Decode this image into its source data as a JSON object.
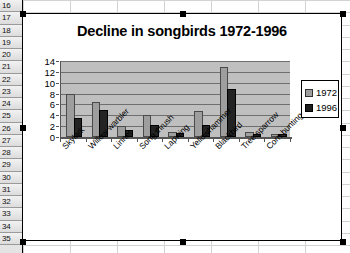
{
  "spreadsheet": {
    "row_headers": [
      "16",
      "17",
      "18",
      "19",
      "20",
      "21",
      "22",
      "23",
      "24",
      "25",
      "26",
      "27",
      "28",
      "29",
      "30",
      "31",
      "32",
      "33",
      "34",
      "35"
    ]
  },
  "chart_object": {
    "selected": true,
    "handle_count": 8
  },
  "chart_data": {
    "type": "bar",
    "title": "Decline in songbirds 1972-1996",
    "xlabel": "",
    "ylabel": "",
    "ylim": [
      0,
      14
    ],
    "yticks": [
      0,
      2,
      4,
      6,
      8,
      10,
      12,
      14
    ],
    "grid": true,
    "legend_position": "right",
    "categories": [
      "Skylark",
      "Willow warbler",
      "Linnet",
      "Song thrush",
      "Lapwing",
      "Yellowhammer",
      "Blackbird",
      "Tree sparrow",
      "Corn bunting"
    ],
    "series": [
      {
        "name": "1972",
        "color": "#9e9e9e",
        "values": [
          7.6,
          6.1,
          1.6,
          3.6,
          0.5,
          4.4,
          12.5,
          0.6,
          0.2
        ]
      },
      {
        "name": "1996",
        "color": "#1d1d1d",
        "values": [
          3.1,
          4.7,
          0.9,
          1.8,
          0.3,
          1.8,
          8.4,
          0.15,
          0.1
        ]
      }
    ]
  }
}
